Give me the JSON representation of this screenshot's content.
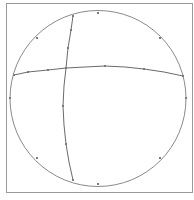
{
  "diagram": {
    "type": "circle-with-arcs",
    "colors": {
      "background": "#ffffff",
      "frame": "#9a9a9a",
      "circle": "#8a8a8a",
      "arcs": "#6a6a6a",
      "markers": "#7a7a7a"
    },
    "frame": {
      "x": 6,
      "y": 3,
      "width": 186,
      "height": 189
    },
    "circle": {
      "cx": 98,
      "cy": 98.5,
      "r": 88
    },
    "circle_markers": [
      [
        98,
        13
      ],
      [
        37,
        38
      ],
      [
        160,
        38
      ],
      [
        10,
        98
      ],
      [
        186,
        98
      ],
      [
        37,
        158
      ],
      [
        160,
        158
      ],
      [
        98,
        184
      ]
    ],
    "vertical_arc": {
      "points": [
        [
          73,
          16
        ],
        [
          71,
          30
        ],
        [
          68,
          48
        ],
        [
          66,
          68
        ],
        [
          64,
          86
        ],
        [
          63,
          106
        ],
        [
          64,
          125
        ],
        [
          66,
          144
        ],
        [
          69,
          162
        ],
        [
          73,
          180
        ]
      ],
      "markers": [
        [
          73,
          16
        ],
        [
          71,
          30
        ],
        [
          68,
          48
        ],
        [
          66,
          68
        ],
        [
          63,
          106
        ],
        [
          66,
          144
        ],
        [
          73,
          180
        ]
      ]
    },
    "horizontal_arc": {
      "points": [
        [
          14,
          75
        ],
        [
          28,
          72
        ],
        [
          48,
          70
        ],
        [
          66,
          68
        ],
        [
          85,
          67
        ],
        [
          105,
          66
        ],
        [
          125,
          67
        ],
        [
          144,
          69
        ],
        [
          164,
          72
        ],
        [
          183,
          76
        ]
      ],
      "markers": [
        [
          14,
          75
        ],
        [
          28,
          72
        ],
        [
          48,
          70
        ],
        [
          66,
          68
        ],
        [
          105,
          66
        ],
        [
          144,
          69
        ],
        [
          183,
          76
        ]
      ]
    }
  }
}
